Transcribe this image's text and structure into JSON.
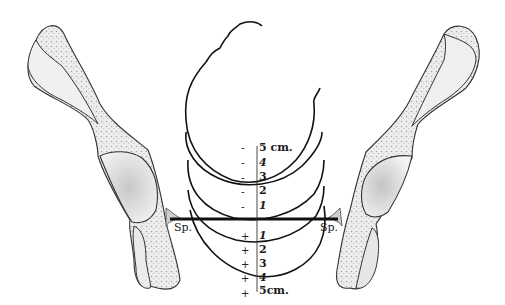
{
  "diagram": {
    "colors": {
      "line": "#1a1a1a",
      "bone_fill": "#ececec",
      "bone_shade": "#d4d4d4",
      "cancellous_dots": "#a8a8a8",
      "background": "#ffffff"
    },
    "landmarks": {
      "left_spine": "Sp.",
      "right_spine": "Sp."
    },
    "scale": {
      "above": [
        {
          "sign": "-",
          "value": "5 cm."
        },
        {
          "sign": "-",
          "value": "4"
        },
        {
          "sign": "-",
          "value": "3"
        },
        {
          "sign": "-",
          "value": "2"
        },
        {
          "sign": "-",
          "value": "1"
        }
      ],
      "below": [
        {
          "sign": "+",
          "value": "1"
        },
        {
          "sign": "+",
          "value": "2"
        },
        {
          "sign": "+",
          "value": "3"
        },
        {
          "sign": "+",
          "value": "4"
        },
        {
          "sign": "+",
          "value": "5cm."
        }
      ]
    }
  }
}
